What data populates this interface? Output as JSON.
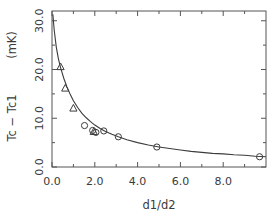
{
  "chart_data": {
    "type": "scatter",
    "title": "",
    "xlabel": "d1/d2",
    "ylabel": "Tc  −  Tc1    (mK)",
    "ylabel_parts": {
      "quantity": "Tc  −  Tc1",
      "units": "(mK)"
    },
    "xlim": [
      0.0,
      10.0
    ],
    "ylim": [
      0.0,
      32.0
    ],
    "xticks": [
      0.0,
      2.0,
      4.0,
      6.0,
      8.0
    ],
    "xticklabels": [
      "0.0",
      "2.0",
      "4.0",
      "6.0",
      "8.0"
    ],
    "yticks": [
      0.0,
      10.0,
      20.0,
      30.0
    ],
    "yticklabels": [
      "0.0",
      "10.0",
      "20.0",
      "30.0"
    ],
    "xminorticks": [
      1.0,
      3.0,
      5.0,
      7.0,
      9.0
    ],
    "yminorticks": [
      5.0,
      15.0,
      25.0
    ],
    "grid": false,
    "legend": "none",
    "frame": "box",
    "series": [
      {
        "name": "triangle-data",
        "marker": "triangle",
        "points": [
          {
            "x": 0.4,
            "y": 20.6
          },
          {
            "x": 0.62,
            "y": 16.2
          },
          {
            "x": 1.0,
            "y": 12.1
          },
          {
            "x": 1.95,
            "y": 7.3
          }
        ]
      },
      {
        "name": "circle-data",
        "marker": "circle",
        "points": [
          {
            "x": 1.52,
            "y": 8.5
          },
          {
            "x": 1.9,
            "y": 7.5
          },
          {
            "x": 2.05,
            "y": 7.1
          },
          {
            "x": 2.42,
            "y": 7.4
          },
          {
            "x": 3.1,
            "y": 6.2
          },
          {
            "x": 4.9,
            "y": 4.1
          },
          {
            "x": 9.7,
            "y": 2.1
          }
        ]
      }
    ],
    "fit_curve": {
      "name": "fit-curve",
      "description": "monotonic decaying fit through data",
      "points": [
        {
          "x": 0.04,
          "y": 31.3
        },
        {
          "x": 0.1,
          "y": 28.2
        },
        {
          "x": 0.2,
          "y": 24.6
        },
        {
          "x": 0.3,
          "y": 22.2
        },
        {
          "x": 0.4,
          "y": 20.4
        },
        {
          "x": 0.55,
          "y": 18.2
        },
        {
          "x": 0.7,
          "y": 16.4
        },
        {
          "x": 0.85,
          "y": 14.9
        },
        {
          "x": 1.0,
          "y": 13.6
        },
        {
          "x": 1.2,
          "y": 12.2
        },
        {
          "x": 1.4,
          "y": 11.0
        },
        {
          "x": 1.6,
          "y": 10.1
        },
        {
          "x": 1.8,
          "y": 9.3
        },
        {
          "x": 2.0,
          "y": 8.6
        },
        {
          "x": 2.25,
          "y": 7.9
        },
        {
          "x": 2.5,
          "y": 7.3
        },
        {
          "x": 2.8,
          "y": 6.7
        },
        {
          "x": 3.1,
          "y": 6.2
        },
        {
          "x": 3.5,
          "y": 5.6
        },
        {
          "x": 4.0,
          "y": 5.0
        },
        {
          "x": 4.5,
          "y": 4.5
        },
        {
          "x": 5.0,
          "y": 4.1
        },
        {
          "x": 5.5,
          "y": 3.8
        },
        {
          "x": 6.0,
          "y": 3.5
        },
        {
          "x": 6.5,
          "y": 3.2
        },
        {
          "x": 7.0,
          "y": 3.0
        },
        {
          "x": 7.5,
          "y": 2.8
        },
        {
          "x": 8.0,
          "y": 2.7
        },
        {
          "x": 8.5,
          "y": 2.5
        },
        {
          "x": 9.0,
          "y": 2.4
        },
        {
          "x": 9.5,
          "y": 2.2
        },
        {
          "x": 10.0,
          "y": 2.1
        }
      ]
    }
  }
}
